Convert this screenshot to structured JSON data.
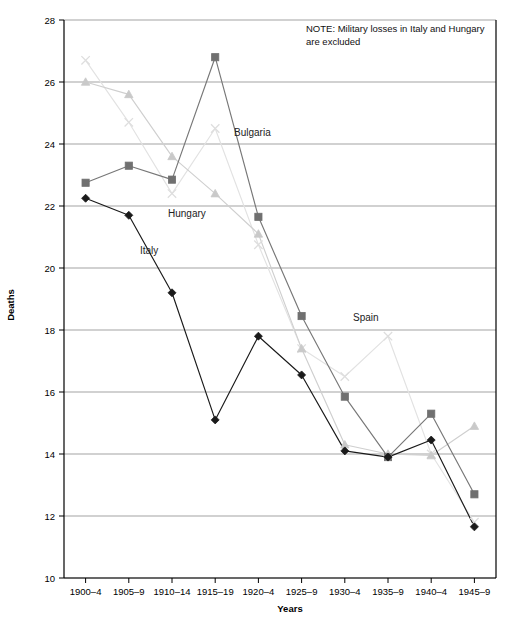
{
  "chart_data": {
    "type": "line",
    "title": "",
    "xlabel": "Years",
    "ylabel": "Deaths",
    "ylim": [
      10,
      28
    ],
    "ytick_step": 2,
    "yticks": [
      "10",
      "12",
      "14",
      "16",
      "18",
      "20",
      "22",
      "24",
      "26",
      "28"
    ],
    "grid": true,
    "legend_position": "inline-annotations",
    "categories": [
      "1900–4",
      "1905–9",
      "1910–14",
      "1915–19",
      "1920–4",
      "1925–9",
      "1930–4",
      "1935–9",
      "1940–4",
      "1945–9"
    ],
    "series": [
      {
        "name": "Italy",
        "marker": "diamond",
        "color": "#1a1a1a",
        "line_color": "#1a1a1a",
        "values": [
          22.25,
          21.7,
          19.2,
          15.1,
          17.8,
          16.55,
          14.1,
          13.9,
          14.45,
          11.65
        ]
      },
      {
        "name": "Bulgaria",
        "marker": "square",
        "color": "#707070",
        "line_color": "#777777",
        "values": [
          22.75,
          23.3,
          22.85,
          26.8,
          21.65,
          18.45,
          15.85,
          13.9,
          15.3,
          12.7
        ]
      },
      {
        "name": "Hungary",
        "marker": "triangle",
        "color": "#c9c9c9",
        "line_color": "#cfcfcf",
        "values": [
          26.0,
          25.6,
          23.6,
          22.4,
          21.1,
          17.4,
          14.3,
          14.0,
          13.95,
          14.9
        ]
      },
      {
        "name": "Spain",
        "marker": "cross",
        "color": "#dedede",
        "line_color": "#e2e2e2",
        "values": [
          26.7,
          24.7,
          22.4,
          24.5,
          20.75,
          17.4,
          16.5,
          17.8,
          14.0,
          11.8
        ]
      }
    ],
    "annotations": [
      {
        "text": "Bulgaria",
        "x_px": 234,
        "y_px": 136
      },
      {
        "text": "Hungary",
        "x_px": 168,
        "y_px": 217
      },
      {
        "text": "Italy",
        "x_px": 140,
        "y_px": 254
      },
      {
        "text": "Spain",
        "x_px": 353,
        "y_px": 321
      }
    ],
    "note": {
      "line1": "NOTE: Military losses in Italy and Hungary",
      "line2": "are excluded",
      "x_px": 306,
      "y_px": 32
    }
  },
  "colors": {
    "background": "#ffffff",
    "axis": "#000000",
    "grid": "#999999",
    "text": "#000000"
  }
}
